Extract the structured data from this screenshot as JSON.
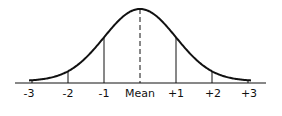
{
  "figure": {
    "type": "normal-distribution-curve",
    "baseline_labels": [
      "-3",
      "-2",
      "-1",
      "Mean",
      "+1",
      "+2",
      "+3"
    ],
    "mean_label": "Mean",
    "line_color": "#111111",
    "background": "#ffffff"
  }
}
